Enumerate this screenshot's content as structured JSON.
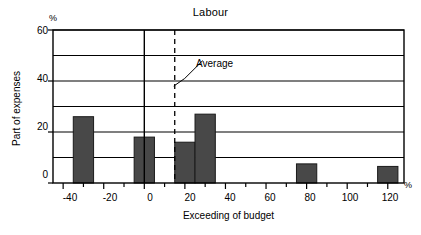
{
  "chart_data": {
    "type": "bar",
    "title": "Labour",
    "xlabel": "Exceeding of budget",
    "ylabel": "Part of expenses",
    "x_unit": "%",
    "y_unit": "%",
    "xlim": [
      -45,
      128
    ],
    "ylim": [
      0,
      60
    ],
    "x_ticks_major": [
      -40,
      -20,
      0,
      20,
      40,
      60,
      80,
      100,
      120
    ],
    "x_tick_labels": [
      "-40",
      "-20",
      "0",
      "20",
      "40",
      "60",
      "80",
      "100",
      "120"
    ],
    "x_ticks_minor_step": 10,
    "y_ticks_major": [
      0,
      20,
      40,
      60
    ],
    "y_tick_labels": [
      "0",
      "20",
      "40",
      "60"
    ],
    "y_gridlines": [
      10,
      20,
      30,
      40,
      50,
      60
    ],
    "grid": true,
    "legend": "none",
    "bins": [
      {
        "x0": -35,
        "x1": -25,
        "value": 26
      },
      {
        "x0": -5,
        "x1": 5,
        "value": 18
      },
      {
        "x0": 15,
        "x1": 25,
        "value": 16
      },
      {
        "x0": 25,
        "x1": 35,
        "value": 27
      },
      {
        "x0": 75,
        "x1": 85,
        "value": 7.5
      },
      {
        "x0": 115,
        "x1": 125,
        "value": 6.5
      }
    ],
    "annotations": [
      {
        "name": "average-line",
        "label": "Average",
        "x": 15,
        "style": "dashed-vertical"
      }
    ],
    "colors": {
      "bar_fill": "#484848",
      "bar_stroke": "#1a1a1a",
      "axis": "#000000",
      "grid": "#000000",
      "background": "#ffffff"
    }
  },
  "labels": {
    "title": "Labour",
    "xlabel": "Exceeding of budget",
    "ylabel": "Part of expenses",
    "y_unit": "%",
    "x_unit": "%",
    "average": "Average",
    "y0": "0",
    "y20": "20",
    "y40": "40",
    "y60": "60",
    "x0": "-40",
    "x1": "-20",
    "x2": "0",
    "x3": "20",
    "x4": "40",
    "x5": "60",
    "x6": "80",
    "x7": "100",
    "x8": "120"
  }
}
